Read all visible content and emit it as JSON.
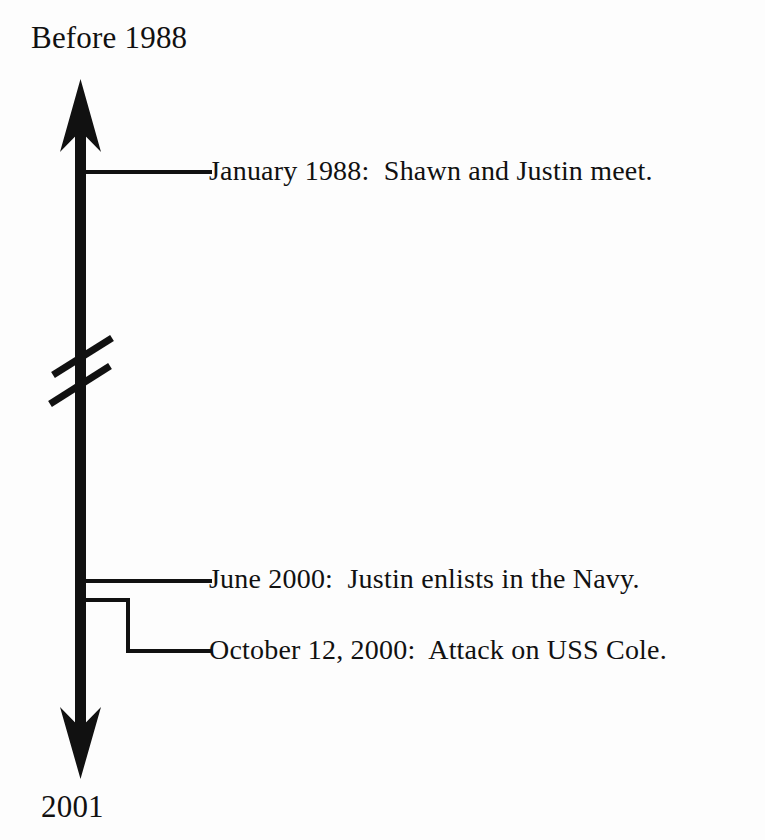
{
  "figure": {
    "type": "vertical-timeline",
    "orientation": "top-to-bottom",
    "background_color": "#fdfdfd",
    "ink_color": "#111111"
  },
  "axis": {
    "start_label": "Before 1988",
    "end_label": "2001",
    "has_arrow_top": true,
    "has_arrow_bottom": true,
    "break_marker": "double-slash"
  },
  "events": [
    {
      "date": "January 1988",
      "text": "January 1988:  Shawn and Justin meet.",
      "connector": "straight"
    },
    {
      "date": "June 2000",
      "text": "June 2000:  Justin enlists in the Navy.",
      "connector": "straight"
    },
    {
      "date": "October 12, 2000",
      "text": "October 12, 2000:  Attack on USS Cole.",
      "connector": "stepped"
    }
  ]
}
